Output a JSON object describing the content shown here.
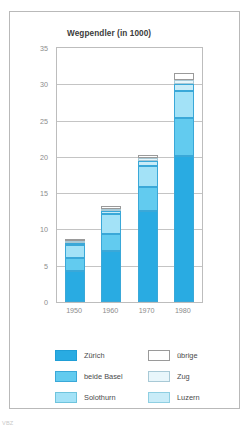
{
  "figure": {
    "title": "Wegpendler (in 1000)",
    "footer_note": "VBZ"
  },
  "legend": {
    "items": [
      {
        "label": "Zürich",
        "color": "#29abe2",
        "border": "#1f9ed6",
        "column": 0,
        "row": 0
      },
      {
        "label": "beide Basel",
        "color": "#62cbef",
        "border": "#3aa8d8",
        "column": 0,
        "row": 1
      },
      {
        "label": "Solothurn",
        "color": "#a3e2f7",
        "border": "#6fc4dd",
        "column": 0,
        "row": 2
      },
      {
        "label": "übrige",
        "color": "#ffffff",
        "border": "#9a9a9a",
        "column": 1,
        "row": 0
      },
      {
        "label": "Zug",
        "color": "#e8f6fb",
        "border": "#a8c9d6",
        "column": 1,
        "row": 1
      },
      {
        "label": "Luzern",
        "color": "#c9ecf8",
        "border": "#8fcfe2",
        "column": 1,
        "row": 2
      }
    ]
  },
  "chart_data": {
    "type": "bar",
    "subtype": "stacked",
    "title": "Wegpendler (in 1000)",
    "xlabel": "",
    "ylabel": "",
    "unit": "in 1000",
    "categories": [
      "1950",
      "1960",
      "1970",
      "1980"
    ],
    "ylim": [
      0,
      35
    ],
    "yticks": [
      0,
      5,
      10,
      15,
      20,
      25,
      30,
      35
    ],
    "grid": true,
    "legend_position": "below",
    "series": [
      {
        "name": "Zürich",
        "color": "#29abe2",
        "values": [
          4.3,
          7.0,
          12.6,
          20.1
        ]
      },
      {
        "name": "beide Basel",
        "color": "#62cbef",
        "values": [
          1.8,
          2.4,
          3.3,
          5.3
        ]
      },
      {
        "name": "Solothurn",
        "color": "#a3e2f7",
        "values": [
          1.8,
          2.7,
          2.9,
          3.7
        ]
      },
      {
        "name": "Luzern",
        "color": "#c9ecf8",
        "values": [
          0.3,
          0.4,
          0.6,
          1.0
        ]
      },
      {
        "name": "Zug",
        "color": "#e8f6fb",
        "values": [
          0.2,
          0.3,
          0.4,
          0.5
        ]
      },
      {
        "name": "übrige",
        "color": "#ffffff",
        "values": [
          0.3,
          0.4,
          0.4,
          1.0
        ]
      }
    ],
    "totals": [
      8.7,
      13.2,
      20.2,
      31.6
    ]
  }
}
